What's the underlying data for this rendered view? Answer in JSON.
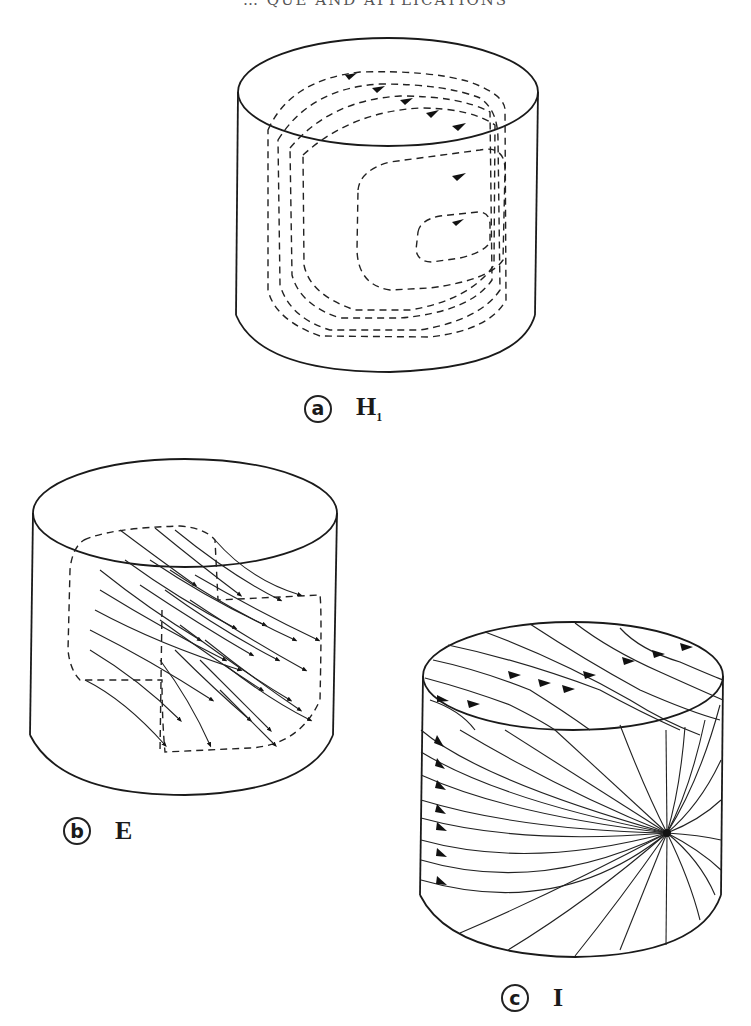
{
  "page": {
    "header_partial": "… QUE AND APPLICATIONS"
  },
  "figures": [
    {
      "id": "a",
      "letter": "a",
      "mode": "H",
      "mode_sub": "1",
      "description": "Cylinder with dashed closed field loops with arrowheads (H1 mode)"
    },
    {
      "id": "b",
      "letter": "b",
      "mode": "E",
      "mode_sub": "",
      "description": "Cylinder with dense arrowed field lines inside dashed region (E mode)"
    },
    {
      "id": "c",
      "letter": "c",
      "mode": "I",
      "mode_sub": "",
      "description": "Cylinder with field lines converging to a singular point on the side (I mode)"
    }
  ],
  "colors": {
    "ink": "#1a1a1a",
    "background": "#ffffff"
  }
}
